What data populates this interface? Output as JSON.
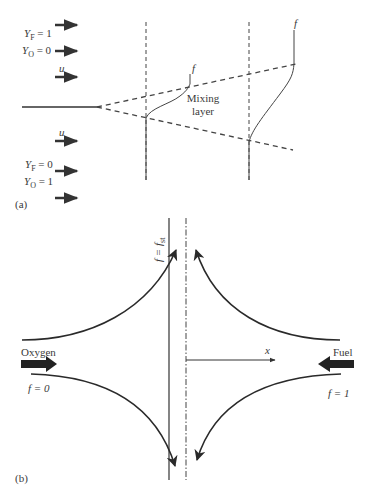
{
  "panel_a": {
    "label": "(a)",
    "top_stream": {
      "yf_label": "Y",
      "yf_sub": "F",
      "yf_value": " = 1",
      "yo_label": "Y",
      "yo_sub": "O",
      "yo_value": " = 0",
      "velocity": "u"
    },
    "bottom_stream": {
      "velocity": "u",
      "yf_label": "Y",
      "yf_sub": "F",
      "yf_value": " = 0",
      "yo_label": "Y",
      "yo_sub": "O",
      "yo_value": " = 1"
    },
    "mixing_layer_line1": "Mixing",
    "mixing_layer_line2": "layer",
    "profile1_label": "f",
    "profile2_label": "f"
  },
  "panel_b": {
    "label": "(b)",
    "stoich_label": "f = f",
    "stoich_sub": "st",
    "x_axis_label": "x",
    "left_stream_label": "Oxygen",
    "left_f_label": "f = 0",
    "right_stream_label": "Fuel",
    "right_f_label": "f = 1"
  },
  "colors": {
    "line": "#333333",
    "text": "#3a3a3a",
    "background": "#ffffff"
  }
}
